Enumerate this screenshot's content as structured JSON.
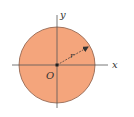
{
  "diagram": {
    "type": "circle-on-axes",
    "labels": {
      "x_axis": "x",
      "y_axis": "y",
      "origin": "O",
      "radius": "r"
    },
    "colors": {
      "circle_fill": "#f4a57c",
      "circle_stroke": "#8a5a44",
      "axis": "#555555",
      "text": "#333333",
      "origin_dot": "#222222"
    },
    "geometry": {
      "center": [
        57,
        65
      ],
      "radius": 38,
      "x_axis_range": [
        12,
        108
      ],
      "y_axis_range": [
        15,
        108
      ],
      "radius_endpoint": [
        88,
        46
      ]
    }
  }
}
